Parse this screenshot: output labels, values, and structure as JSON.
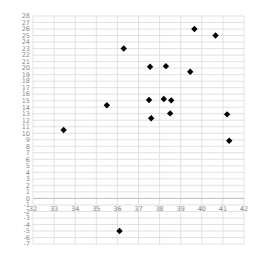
{
  "chart_data": {
    "type": "scatter",
    "title": "",
    "xlabel": "",
    "ylabel": "",
    "xlim": [
      32,
      42
    ],
    "ylim": [
      -7,
      28
    ],
    "x_ticks": [
      32,
      33,
      34,
      35,
      36,
      37,
      38,
      39,
      40,
      41,
      42
    ],
    "y_ticks": [
      -7,
      -6,
      -5,
      -4,
      -3,
      -2,
      -1,
      0,
      1,
      2,
      3,
      4,
      5,
      6,
      7,
      8,
      9,
      10,
      11,
      12,
      13,
      14,
      15,
      16,
      17,
      18,
      19,
      20,
      21,
      22,
      23,
      24,
      25,
      26,
      27,
      28
    ],
    "grid": true,
    "legend": null,
    "marker": "diamond",
    "marker_color": "#000000",
    "grid_color": "#d4d4d4",
    "tick_color": "#888888",
    "points": [
      {
        "x": 33.45,
        "y": 10.5
      },
      {
        "x": 35.5,
        "y": 14.3
      },
      {
        "x": 36.3,
        "y": 23.0
      },
      {
        "x": 36.1,
        "y": -5.0
      },
      {
        "x": 37.55,
        "y": 20.2
      },
      {
        "x": 37.5,
        "y": 15.1
      },
      {
        "x": 37.6,
        "y": 12.3
      },
      {
        "x": 38.3,
        "y": 20.3
      },
      {
        "x": 38.2,
        "y": 15.25
      },
      {
        "x": 38.55,
        "y": 15.05
      },
      {
        "x": 38.5,
        "y": 13.05
      },
      {
        "x": 39.45,
        "y": 19.45
      },
      {
        "x": 39.65,
        "y": 26.0
      },
      {
        "x": 40.65,
        "y": 25.0
      },
      {
        "x": 41.2,
        "y": 12.9
      },
      {
        "x": 41.3,
        "y": 8.85
      }
    ]
  }
}
